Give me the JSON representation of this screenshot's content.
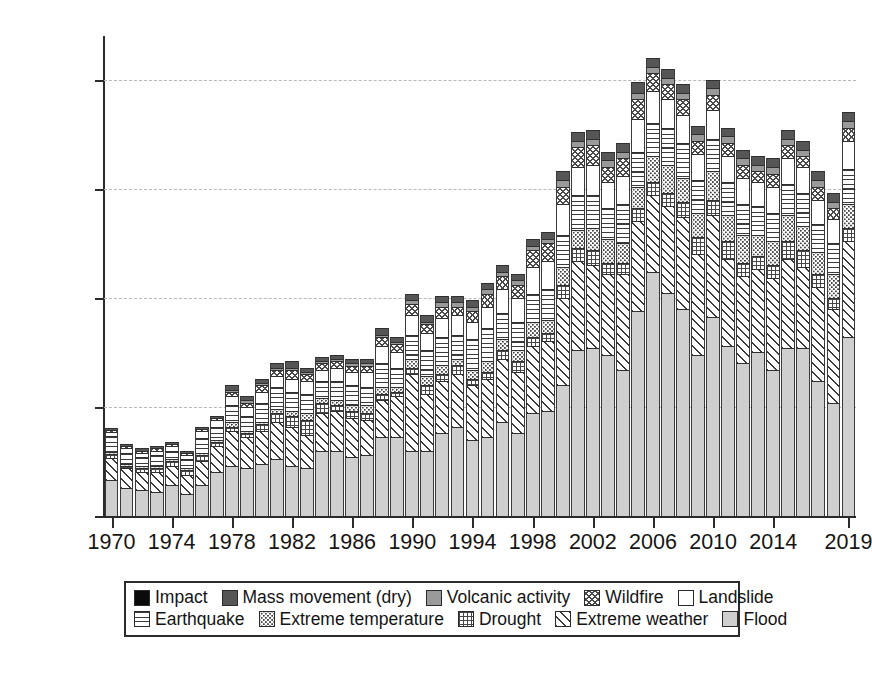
{
  "chart_data": {
    "type": "bar",
    "subtype": "stacked-bar",
    "title": "",
    "xlabel": "",
    "ylabel": "Number of incidences",
    "ylim": [
      0,
      440
    ],
    "yticks": [
      0,
      100,
      200,
      300,
      400
    ],
    "grid": "horizontal-dashed",
    "legend_position": "below-axes",
    "x": [
      1970,
      1971,
      1972,
      1973,
      1974,
      1975,
      1976,
      1977,
      1978,
      1979,
      1980,
      1981,
      1982,
      1983,
      1984,
      1985,
      1986,
      1987,
      1988,
      1989,
      1990,
      1991,
      1992,
      1993,
      1994,
      1995,
      1996,
      1997,
      1998,
      1999,
      2000,
      2001,
      2002,
      2003,
      2004,
      2005,
      2006,
      2007,
      2008,
      2009,
      2010,
      2011,
      2012,
      2013,
      2014,
      2015,
      2016,
      2017,
      2018,
      2019
    ],
    "xtick_labels": [
      "1970",
      "1974",
      "1978",
      "1982",
      "1986",
      "1990",
      "1994",
      "1998",
      "2002",
      "2006",
      "2010",
      "2014",
      "2019"
    ],
    "xtick_values": [
      1970,
      1974,
      1978,
      1982,
      1986,
      1990,
      1994,
      1998,
      2002,
      2006,
      2010,
      2014,
      2019
    ],
    "stack_order_bottom_to_top": [
      "Flood",
      "Extreme weather",
      "Drought",
      "Extreme temperature",
      "Earthquake",
      "Landslide",
      "Wildfire",
      "Volcanic activity",
      "Mass movement (dry)",
      "Impact"
    ],
    "series": [
      {
        "name": "Flood",
        "pattern": "solid-light-gray",
        "color": "#cfcfcf",
        "values": [
          33,
          26,
          24,
          22,
          28,
          20,
          28,
          40,
          46,
          44,
          48,
          52,
          46,
          44,
          60,
          60,
          54,
          56,
          72,
          72,
          60,
          60,
          76,
          82,
          70,
          72,
          86,
          76,
          94,
          96,
          120,
          152,
          154,
          148,
          134,
          188,
          224,
          204,
          190,
          148,
          182,
          156,
          140,
          150,
          134,
          154,
          154,
          124,
          104,
          164
        ]
      },
      {
        "name": "Extreme weather",
        "pattern": "diagonal-hatch",
        "color": "#3a3a3a",
        "values": [
          20,
          18,
          16,
          18,
          18,
          18,
          22,
          24,
          32,
          28,
          30,
          34,
          36,
          30,
          34,
          36,
          36,
          32,
          34,
          38,
          70,
          52,
          48,
          48,
          50,
          54,
          58,
          56,
          62,
          64,
          80,
          82,
          76,
          74,
          88,
          82,
          70,
          80,
          84,
          92,
          94,
          80,
          80,
          76,
          84,
          82,
          74,
          86,
          86,
          88
        ]
      },
      {
        "name": "Drought",
        "pattern": "grid",
        "color": "#474747",
        "values": [
          4,
          2,
          4,
          4,
          4,
          4,
          6,
          4,
          4,
          4,
          6,
          8,
          10,
          14,
          10,
          6,
          6,
          6,
          6,
          4,
          6,
          8,
          6,
          8,
          6,
          6,
          8,
          10,
          8,
          8,
          12,
          12,
          14,
          10,
          10,
          12,
          12,
          12,
          14,
          16,
          14,
          16,
          12,
          12,
          12,
          16,
          16,
          12,
          10,
          12
        ]
      },
      {
        "name": "Extreme temperature",
        "pattern": "dotted",
        "color": "#3d3d3d",
        "values": [
          2,
          2,
          2,
          2,
          2,
          2,
          2,
          2,
          4,
          2,
          2,
          4,
          4,
          6,
          4,
          4,
          6,
          8,
          6,
          4,
          8,
          8,
          8,
          6,
          8,
          10,
          10,
          10,
          14,
          12,
          16,
          16,
          20,
          22,
          18,
          20,
          24,
          26,
          22,
          22,
          26,
          24,
          26,
          20,
          22,
          24,
          22,
          20,
          22,
          22
        ]
      },
      {
        "name": "Earthquake",
        "pattern": "horizontal-lines",
        "color": "#3b3b3b",
        "values": [
          14,
          10,
          8,
          10,
          8,
          8,
          14,
          12,
          16,
          14,
          18,
          20,
          18,
          18,
          16,
          18,
          18,
          16,
          22,
          18,
          22,
          24,
          26,
          22,
          28,
          30,
          24,
          26,
          26,
          28,
          30,
          32,
          30,
          28,
          36,
          32,
          30,
          34,
          32,
          30,
          30,
          30,
          28,
          26,
          26,
          28,
          30,
          26,
          28,
          32
        ]
      },
      {
        "name": "Landslide",
        "pattern": "white",
        "color": "#ffffff",
        "values": [
          4,
          4,
          4,
          4,
          4,
          4,
          6,
          6,
          8,
          8,
          10,
          10,
          12,
          12,
          10,
          12,
          12,
          14,
          16,
          14,
          18,
          16,
          18,
          18,
          16,
          20,
          22,
          22,
          24,
          26,
          28,
          26,
          28,
          24,
          26,
          30,
          30,
          26,
          26,
          24,
          26,
          24,
          24,
          22,
          24,
          24,
          24,
          22,
          22,
          26
        ]
      },
      {
        "name": "Wildfire",
        "pattern": "crosshatch",
        "color": "#4a4a4a",
        "values": [
          2,
          2,
          2,
          2,
          2,
          2,
          2,
          2,
          4,
          4,
          6,
          6,
          8,
          6,
          6,
          6,
          6,
          6,
          8,
          8,
          10,
          8,
          10,
          8,
          10,
          12,
          12,
          12,
          16,
          16,
          16,
          18,
          18,
          14,
          16,
          18,
          16,
          14,
          14,
          12,
          14,
          12,
          12,
          10,
          12,
          12,
          10,
          12,
          10,
          12
        ]
      },
      {
        "name": "Volcanic activity",
        "pattern": "medium-gray",
        "color": "#9a9a9a",
        "values": [
          0,
          0,
          0,
          0,
          0,
          0,
          0,
          0,
          2,
          2,
          2,
          2,
          2,
          2,
          2,
          2,
          2,
          2,
          2,
          2,
          4,
          2,
          4,
          4,
          4,
          4,
          4,
          4,
          4,
          4,
          6,
          6,
          6,
          6,
          6,
          6,
          6,
          6,
          6,
          6,
          6,
          6,
          6,
          6,
          6,
          6,
          6,
          6,
          6,
          6
        ]
      },
      {
        "name": "Mass movement (dry)",
        "pattern": "dark-gray",
        "color": "#565656",
        "values": [
          2,
          2,
          2,
          2,
          2,
          2,
          2,
          2,
          4,
          4,
          4,
          4,
          6,
          4,
          4,
          4,
          4,
          4,
          6,
          4,
          6,
          6,
          6,
          6,
          6,
          6,
          6,
          6,
          6,
          6,
          8,
          8,
          8,
          8,
          8,
          10,
          8,
          8,
          8,
          8,
          8,
          8,
          8,
          8,
          8,
          8,
          8,
          8,
          8,
          8
        ]
      },
      {
        "name": "Impact",
        "pattern": "solid-black",
        "color": "#0b0b0b",
        "values": [
          0,
          0,
          0,
          0,
          0,
          0,
          0,
          0,
          0,
          0,
          0,
          0,
          0,
          0,
          0,
          0,
          0,
          0,
          0,
          0,
          0,
          0,
          0,
          0,
          0,
          0,
          0,
          0,
          0,
          0,
          0,
          0,
          0,
          0,
          0,
          0,
          0,
          0,
          0,
          0,
          0,
          0,
          0,
          0,
          0,
          0,
          0,
          0,
          0,
          0
        ]
      }
    ],
    "totals": [
      81,
      66,
      62,
      64,
      68,
      60,
      82,
      92,
      120,
      110,
      126,
      140,
      142,
      136,
      146,
      148,
      144,
      144,
      172,
      164,
      204,
      184,
      202,
      202,
      198,
      214,
      230,
      222,
      254,
      260,
      316,
      352,
      354,
      334,
      342,
      398,
      420,
      410,
      396,
      358,
      400,
      356,
      336,
      330,
      328,
      354,
      344,
      316,
      296,
      364
    ]
  },
  "axes": {
    "y_title": "Number of incidences",
    "y_tick_labels": [
      "0",
      "100",
      "200",
      "300",
      "400"
    ]
  },
  "legend": {
    "row1": [
      {
        "label": "Impact",
        "pattern": "p-impact"
      },
      {
        "label": "Mass movement (dry)",
        "pattern": "p-massmovement"
      },
      {
        "label": "Volcanic activity",
        "pattern": "p-volcanic"
      },
      {
        "label": "Wildfire",
        "pattern": "p-wildfire"
      },
      {
        "label": "Landslide",
        "pattern": "p-landslide"
      }
    ],
    "row2": [
      {
        "label": "Earthquake",
        "pattern": "p-earthquake"
      },
      {
        "label": "Extreme temperature",
        "pattern": "p-extremetemp"
      },
      {
        "label": "Drought",
        "pattern": "p-drought"
      },
      {
        "label": "Extreme weather",
        "pattern": "p-extremeweather"
      },
      {
        "label": "Flood",
        "pattern": "p-flood"
      }
    ]
  }
}
